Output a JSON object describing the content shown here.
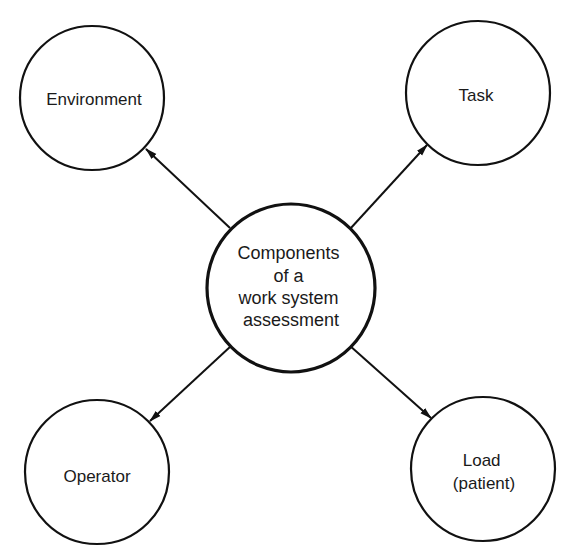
{
  "diagram": {
    "type": "hub-and-spoke",
    "center": {
      "lines": [
        "Components",
        "of a",
        "work system",
        "assessment"
      ]
    },
    "nodes": {
      "environment": {
        "lines": [
          "Environment"
        ],
        "position": "top-left"
      },
      "task": {
        "lines": [
          "Task"
        ],
        "position": "top-right"
      },
      "operator": {
        "lines": [
          "Operator"
        ],
        "position": "bottom-left"
      },
      "load": {
        "lines": [
          "Load",
          "(patient)"
        ],
        "position": "bottom-right"
      }
    },
    "edges": [
      {
        "from": "center",
        "to": "environment",
        "arrow": "to"
      },
      {
        "from": "center",
        "to": "task",
        "arrow": "to"
      },
      {
        "from": "center",
        "to": "operator",
        "arrow": "to"
      },
      {
        "from": "center",
        "to": "load",
        "arrow": "to"
      }
    ],
    "colors": {
      "stroke": "#111111",
      "background": "#ffffff",
      "text": "#1a1a1a"
    }
  }
}
